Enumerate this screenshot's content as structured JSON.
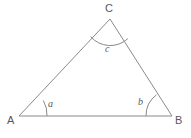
{
  "figure": {
    "kind": "triangle-angle-diagram",
    "background_color": "#ffffff",
    "stroke_color": "#8a8a8a",
    "text_color": "#58585a",
    "stroke_width": 1,
    "vertices": [
      {
        "id": "A",
        "label": "A",
        "x": 19,
        "y": 116
      },
      {
        "id": "B",
        "label": "B",
        "x": 172,
        "y": 116
      },
      {
        "id": "C",
        "label": "C",
        "x": 110,
        "y": 19
      }
    ],
    "sides": [
      {
        "id": "AB",
        "from": "A",
        "to": "B"
      },
      {
        "id": "AC",
        "from": "A",
        "to": "C"
      },
      {
        "id": "BC",
        "from": "B",
        "to": "C"
      }
    ],
    "angles": [
      {
        "id": "a",
        "label": "a",
        "at_vertex": "A",
        "arc_radius": 28
      },
      {
        "id": "b",
        "label": "b",
        "at_vertex": "B",
        "arc_radius": 26
      },
      {
        "id": "c",
        "label": "c",
        "at_vertex": "C",
        "arc_radius": 26
      }
    ],
    "arc_paths": {
      "a": "M 43.3 100.5 A 28 28 0 0 1 47 116",
      "b": "M 146 116 A 26 26 0 0 1 156.5 94.8",
      "c": "M 90.6 36.6 A 26 26 0 0 0 127.9 38.6"
    },
    "triangle_path": "M 19 116 L 172 116 L 110 19 Z"
  }
}
